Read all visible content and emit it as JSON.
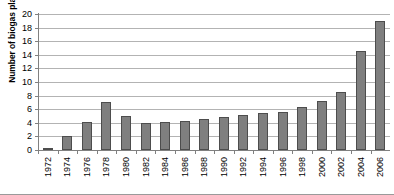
{
  "chart_data": {
    "type": "bar",
    "title": "",
    "xlabel": "",
    "ylabel": "Number of biogas plants in Mio",
    "ylim": [
      0,
      20
    ],
    "ytick_step": 2,
    "yticks": [
      0,
      2,
      4,
      6,
      8,
      10,
      12,
      14,
      16,
      18,
      20
    ],
    "grid": true,
    "legend": "none",
    "categories": [
      "1972",
      "1974",
      "1976",
      "1978",
      "1980",
      "1982",
      "1984",
      "1986",
      "1988",
      "1990",
      "1992",
      "1994",
      "1996",
      "1998",
      "2000",
      "2002",
      "2004",
      "2006"
    ],
    "values": [
      0.3,
      2.0,
      4.1,
      7.0,
      5.0,
      4.0,
      4.1,
      4.2,
      4.5,
      4.8,
      5.1,
      5.4,
      5.6,
      6.3,
      7.2,
      8.5,
      14.5,
      19.0
    ],
    "series": [
      {
        "name": "Number of biogas plants in Mio",
        "values": [
          0.3,
          2.0,
          4.1,
          7.0,
          5.0,
          4.0,
          4.1,
          4.2,
          4.5,
          4.8,
          5.1,
          5.4,
          5.6,
          6.3,
          7.2,
          8.5,
          14.5,
          19.0
        ]
      }
    ],
    "colors": {
      "bar_fill": "#7f7f7f",
      "bar_border": "#4d4d4d",
      "gridline": "#b3b3b3",
      "axis": "#808080",
      "background": "#ffffff",
      "text": "#000000"
    }
  }
}
